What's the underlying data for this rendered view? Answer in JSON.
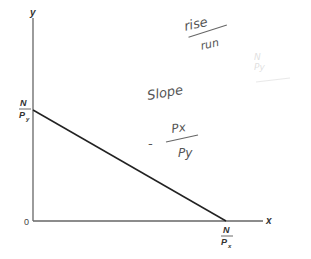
{
  "diagram": {
    "type": "budget-line",
    "axes": {
      "x_label": "x",
      "y_label": "y",
      "origin_label": "0"
    },
    "intercepts": {
      "y_intercept": {
        "numerator": "N",
        "denominator": "P",
        "subscript": "y"
      },
      "x_intercept": {
        "numerator": "N",
        "denominator": "P",
        "subscript": "x"
      }
    },
    "handwritten_notes": {
      "rise_over_run": {
        "numerator": "rise",
        "denominator": "run"
      },
      "slope_label": "Slope",
      "slope_formula": {
        "sign": "-",
        "numerator": "Px",
        "denominator": "Py"
      },
      "faint_note": {
        "numerator": "N",
        "denominator": "Py"
      }
    },
    "colors": {
      "axis": "#555555",
      "line": "#222222",
      "handwriting": "#666666"
    }
  }
}
